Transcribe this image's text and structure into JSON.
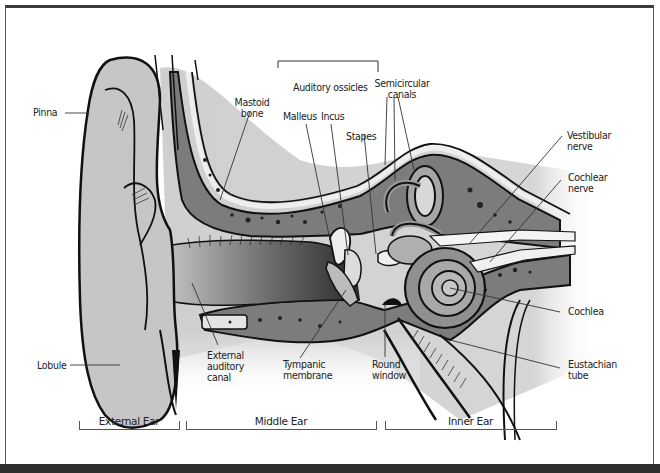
{
  "diagram": {
    "colors": {
      "outline": "#111111",
      "skin": "#c8c8c8",
      "bone": "#7a7a7a",
      "cartilage": "#e2e2e2",
      "shadow": "#3a3a3a",
      "background": "#ffffff"
    },
    "labels": {
      "pinna": "Pinna",
      "mastoid_bone": "Mastoid\nbone",
      "auditory_ossicles": "Auditory ossicles",
      "malleus": "Malleus",
      "incus": "Incus",
      "stapes": "Stapes",
      "semicircular_canals": "Semicircular\ncanals",
      "vestibular_nerve": "Vestibular\nnerve",
      "cochlear_nerve": "Cochlear\nnerve",
      "cochlea": "Cochlea",
      "eustachian_tube": "Eustachian\ntube",
      "round_window": "Round\nwindow",
      "tympanic_membrane": "Tympanic\nmembrane",
      "external_auditory_canal": "External\nauditory\ncanal",
      "lobule": "Lobule"
    },
    "sections": [
      {
        "label": "External Ear"
      },
      {
        "label": "Middle Ear"
      },
      {
        "label": "Inner Ear"
      }
    ]
  }
}
